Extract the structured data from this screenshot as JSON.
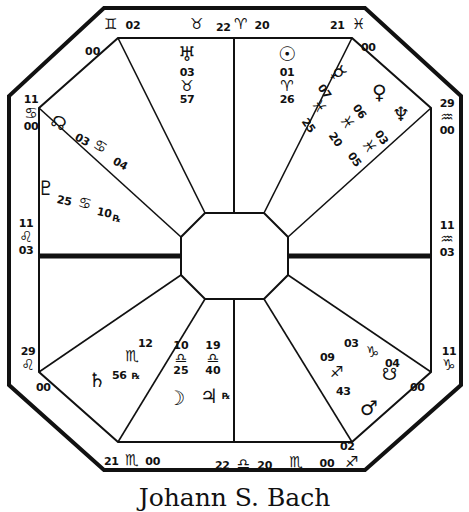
{
  "chart": {
    "title": "Johann S. Bach",
    "type": "square-wheel natal horoscope (octagonal form)",
    "stroke_color": "#111111",
    "background": "#ffffff"
  },
  "cusps": {
    "top_left": {
      "degree": "02",
      "sign_glyph": "♊",
      "sign": "Gemini",
      "minute": "00"
    },
    "top_mid_left": {
      "degree": "22",
      "sign_glyph": "♉",
      "sign": "Taurus",
      "minute": ""
    },
    "top_mid_right": {
      "degree": "",
      "sign_glyph": "♈",
      "sign": "Aries",
      "minute": "20"
    },
    "top_right": {
      "degree": "21",
      "sign_glyph": "♓",
      "sign": "Pisces",
      "minute": "00"
    },
    "right_upper": {
      "degree": "29",
      "sign_glyph": "♒",
      "sign": "Aquarius",
      "minute": "00"
    },
    "right_mid": {
      "degree": "11",
      "sign_glyph": "♒",
      "sign": "Aquarius",
      "minute": "03"
    },
    "right_lower": {
      "degree": "11",
      "sign_glyph": "♑",
      "sign": "Capricorn",
      "minute": "00"
    },
    "bottom_right": {
      "degree": "02",
      "sign_glyph": "♐",
      "sign": "Sagittarius",
      "minute": "00"
    },
    "bottom_mid_r": {
      "degree": "",
      "sign_glyph": "♏",
      "sign": "Scorpio",
      "minute": "00"
    },
    "bottom_mid_l": {
      "degree": "22",
      "sign_glyph": "♎",
      "sign": "Libra",
      "minute": "20"
    },
    "bottom_left": {
      "degree": "21",
      "sign_glyph": "♏",
      "sign": "Scorpio",
      "minute": "00"
    },
    "left_lower": {
      "degree": "29",
      "sign_glyph": "♌",
      "sign": "Leo",
      "minute": "00"
    },
    "left_mid": {
      "degree": "11",
      "sign_glyph": "♌",
      "sign": "Leo",
      "minute": "03"
    },
    "left_upper": {
      "degree": "11",
      "sign_glyph": "♋",
      "sign": "Cancer",
      "minute": "00"
    }
  },
  "planets": {
    "uranus": {
      "name": "Uranus",
      "glyph": "♅",
      "degree": "03",
      "sign_glyph": "♉",
      "sign": "Taurus",
      "minute": "57",
      "retrograde": false
    },
    "sun": {
      "name": "Sun",
      "glyph": "☉",
      "degree": "01",
      "sign_glyph": "♈",
      "sign": "Aries",
      "minute": "26",
      "retrograde": false
    },
    "mercury": {
      "name": "Mercury",
      "glyph": "☿",
      "degree": "07",
      "sign_glyph": "♓",
      "sign": "Pisces",
      "minute": "25",
      "retrograde": false
    },
    "venus": {
      "name": "Venus",
      "glyph": "♀",
      "degree": "06",
      "sign_glyph": "♓",
      "sign": "Pisces",
      "minute": "20",
      "retrograde": false
    },
    "neptune": {
      "name": "Neptune",
      "glyph": "♆",
      "degree": "03",
      "sign_glyph": "♓",
      "sign": "Pisces",
      "minute": "05",
      "retrograde": false
    },
    "north_node": {
      "name": "North Node",
      "glyph": "☊",
      "degree": "03",
      "sign_glyph": "♋",
      "sign": "Cancer",
      "minute": "04",
      "retrograde": false
    },
    "pluto": {
      "name": "Pluto",
      "glyph": "♇",
      "degree": "25",
      "sign_glyph": "♋",
      "sign": "Cancer",
      "minute": "10",
      "retrograde": true
    },
    "saturn": {
      "name": "Saturn",
      "glyph": "♄",
      "degree": "12",
      "sign_glyph": "♏",
      "sign": "Scorpio",
      "minute": "56",
      "retrograde": true
    },
    "moon": {
      "name": "Moon",
      "glyph": "☽",
      "degree": "10",
      "sign_glyph": "♎",
      "sign": "Libra",
      "minute": "25",
      "retrograde": false
    },
    "jupiter": {
      "name": "Jupiter",
      "glyph": "♃",
      "degree": "19",
      "sign_glyph": "♎",
      "sign": "Libra",
      "minute": "40",
      "retrograde": true
    },
    "mars": {
      "name": "Mars",
      "glyph": "♂",
      "degree": "09",
      "sign_glyph": "♐",
      "sign": "Sagittarius",
      "minute": "43",
      "retrograde": false
    },
    "south_node": {
      "name": "South Node",
      "glyph": "☋",
      "degree": "03",
      "sign_glyph": "♑",
      "sign": "Capricorn",
      "minute": "04",
      "retrograde": false
    }
  },
  "symbols": {
    "retrograde": "℞"
  }
}
